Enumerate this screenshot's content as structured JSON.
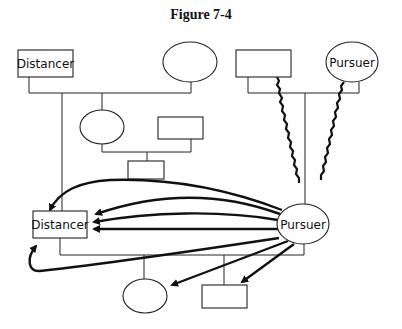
{
  "figure": {
    "title": "Figure 7-4"
  },
  "nodes": {
    "top_left_rect": {
      "label": "Distancer",
      "shape": "rect"
    },
    "top_left_ellipse": {
      "label": "",
      "shape": "ellipse"
    },
    "top_right_rect": {
      "label": "",
      "shape": "rect"
    },
    "top_right_ellipse": {
      "label": "Pursuer",
      "shape": "ellipse"
    },
    "mid_ellipse": {
      "label": "",
      "shape": "ellipse"
    },
    "mid_rect": {
      "label": "",
      "shape": "rect"
    },
    "small_child_rect": {
      "label": "",
      "shape": "rect"
    },
    "center_distancer": {
      "label": "Distancer",
      "shape": "rect"
    },
    "center_pursuer": {
      "label": "Pursuer",
      "shape": "ellipse"
    },
    "bottom_ellipse": {
      "label": "",
      "shape": "ellipse"
    },
    "bottom_rect": {
      "label": "",
      "shape": "rect"
    }
  },
  "edges": {
    "pursuit_arrows": 7,
    "conflict_lines": 2,
    "arrow_source": "Pursuer",
    "arrow_targets": [
      "Distancer",
      "Distancer",
      "Distancer",
      "Distancer",
      "Distancer",
      "bottom_ellipse",
      "bottom_rect"
    ]
  }
}
